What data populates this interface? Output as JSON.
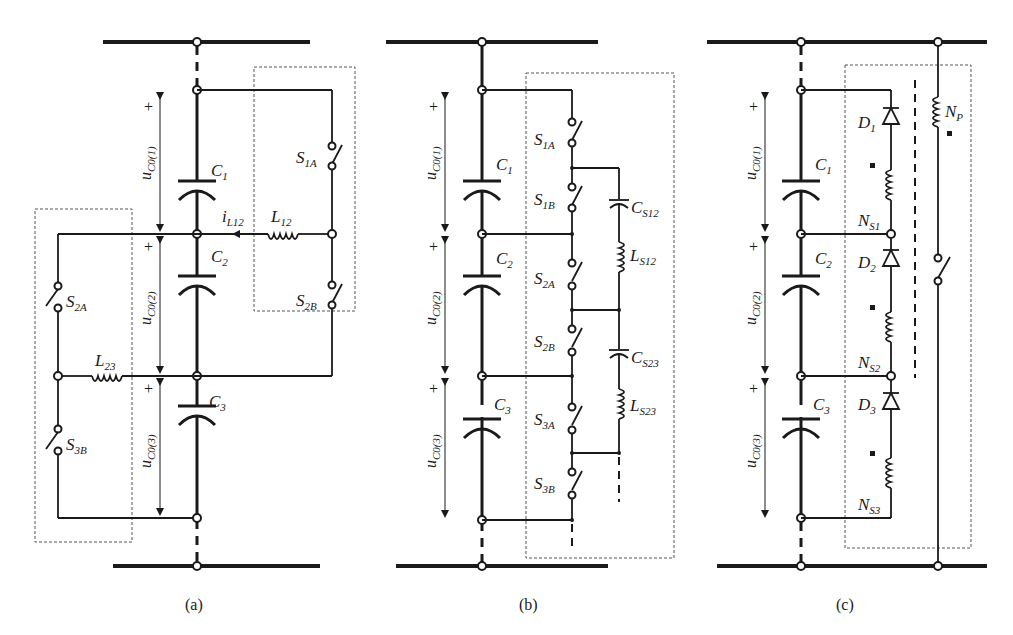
{
  "figure": {
    "panels": [
      {
        "id": "a",
        "caption": "(a)",
        "capacitors": [
          "C",
          "C",
          "C"
        ],
        "capacitor_subs": [
          "1",
          "2",
          "3"
        ],
        "voltages": [
          {
            "main": "u",
            "sub": "C0(1)"
          },
          {
            "main": "u",
            "sub": "C0(2)"
          },
          {
            "main": "u",
            "sub": "C0(3)"
          }
        ],
        "switches": [
          {
            "main": "S",
            "sub": "1A"
          },
          {
            "main": "S",
            "sub": "2B"
          },
          {
            "main": "S",
            "sub": "2A"
          },
          {
            "main": "S",
            "sub": "3B"
          }
        ],
        "inductors": [
          {
            "main": "L",
            "sub": "12"
          },
          {
            "main": "L",
            "sub": "23"
          }
        ],
        "current": {
          "main": "i",
          "sub": "L12"
        },
        "plus_sign": "+"
      },
      {
        "id": "b",
        "caption": "(b)",
        "capacitors": [
          "C",
          "C",
          "C"
        ],
        "capacitor_subs": [
          "1",
          "2",
          "3"
        ],
        "voltages": [
          {
            "main": "u",
            "sub": "C0(1)"
          },
          {
            "main": "u",
            "sub": "C0(2)"
          },
          {
            "main": "u",
            "sub": "C0(3)"
          }
        ],
        "switches": [
          {
            "main": "S",
            "sub": "1A"
          },
          {
            "main": "S",
            "sub": "1B"
          },
          {
            "main": "S",
            "sub": "2A"
          },
          {
            "main": "S",
            "sub": "2B"
          },
          {
            "main": "S",
            "sub": "3A"
          },
          {
            "main": "S",
            "sub": "3B"
          }
        ],
        "resonant_caps": [
          {
            "main": "C",
            "sub": "S12"
          },
          {
            "main": "C",
            "sub": "S23"
          }
        ],
        "resonant_inductors": [
          {
            "main": "L",
            "sub": "S12"
          },
          {
            "main": "L",
            "sub": "S23"
          }
        ],
        "plus_sign": "+"
      },
      {
        "id": "c",
        "caption": "(c)",
        "capacitors": [
          "C",
          "C",
          "C"
        ],
        "capacitor_subs": [
          "1",
          "2",
          "3"
        ],
        "voltages": [
          {
            "main": "u",
            "sub": "C0(1)"
          },
          {
            "main": "u",
            "sub": "C0(2)"
          },
          {
            "main": "u",
            "sub": "C0(3)"
          }
        ],
        "diodes": [
          {
            "main": "D",
            "sub": "1"
          },
          {
            "main": "D",
            "sub": "2"
          },
          {
            "main": "D",
            "sub": "3"
          }
        ],
        "secondary_windings": [
          {
            "main": "N",
            "sub": "S1"
          },
          {
            "main": "N",
            "sub": "S2"
          },
          {
            "main": "N",
            "sub": "S3"
          }
        ],
        "primary_winding": {
          "main": "N",
          "sub": "P"
        },
        "plus_sign": "+"
      }
    ]
  }
}
